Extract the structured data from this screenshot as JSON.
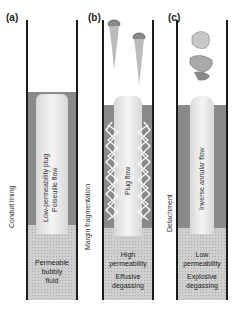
{
  "panels": [
    {
      "id": "a",
      "label": "(a)",
      "side_label": "Conduit lining",
      "inner_label": [
        "Low-permeability plug",
        "Poiseuille flow"
      ],
      "bottom_label": [
        "Permeable",
        "bubbly",
        "fluid"
      ]
    },
    {
      "id": "b",
      "label": "(b)",
      "side_label": "Margin fragmentation",
      "inner_label": [
        "Plug flow"
      ],
      "bottom_label": [
        "High",
        "permeability",
        "Effusive",
        "degassing"
      ]
    },
    {
      "id": "c",
      "label": "(c)",
      "side_label": "Detachment",
      "inner_label": [
        "Inverse annular flow"
      ],
      "bottom_label": [
        "Low",
        "permeability",
        "Explosive",
        "degassing"
      ]
    }
  ],
  "colors": {
    "wall": "#1a1a1a",
    "lining": "#8a8a8a",
    "fluid": "#cfcfcf",
    "plug": "#eeeeee"
  }
}
